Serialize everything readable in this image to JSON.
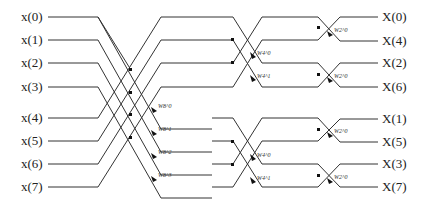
{
  "inputs": [
    {
      "label": "x(0)",
      "y": 17
    },
    {
      "label": "x(1)",
      "y": 40
    },
    {
      "label": "x(2)",
      "y": 63
    },
    {
      "label": "x(3)",
      "y": 87
    },
    {
      "label": "x(4)",
      "y": 118
    },
    {
      "label": "x(5)",
      "y": 141
    },
    {
      "label": "x(6)",
      "y": 164
    },
    {
      "label": "x(7)",
      "y": 187
    }
  ],
  "outputs": [
    {
      "label": "X(0)",
      "y": 17
    },
    {
      "label": "X(4)",
      "y": 41
    },
    {
      "label": "X(2)",
      "y": 63
    },
    {
      "label": "X(6)",
      "y": 87
    },
    {
      "label": "X(1)",
      "y": 119
    },
    {
      "label": "X(5)",
      "y": 142
    },
    {
      "label": "X(3)",
      "y": 164
    },
    {
      "label": "X(7)",
      "y": 187
    }
  ],
  "twiddles": {
    "stage1": [
      "W8^0",
      "W8^1",
      "W8^2",
      "W8^3"
    ],
    "stage2": [
      "W4^0",
      "W4^1",
      "W4^0",
      "W4^1"
    ],
    "stage3": [
      "W2^0",
      "W2^0",
      "W2^0",
      "W2^0"
    ]
  },
  "colors": {
    "line": "#333333",
    "node": "#111111"
  }
}
